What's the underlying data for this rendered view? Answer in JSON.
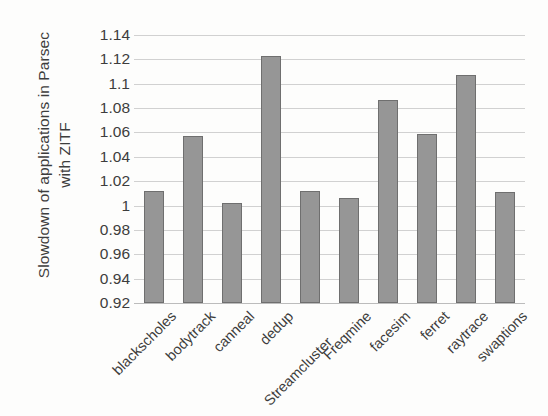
{
  "chart_data": {
    "type": "bar",
    "title": "",
    "xlabel": "",
    "ylabel": "Slowdown of applications in Parsec with ZITF",
    "ylabel_lines": [
      "Slowdown of applications in Parsec",
      "with ZITF"
    ],
    "ylim": [
      0.92,
      1.14
    ],
    "ytick_step": 0.02,
    "ytick_labels": [
      "1.14",
      "1.12",
      "1.1",
      "1.08",
      "1.06",
      "1.04",
      "1.02",
      "1",
      "0.98",
      "0.96",
      "0.94",
      "0.92"
    ],
    "ytick_values": [
      1.14,
      1.12,
      1.1,
      1.08,
      1.06,
      1.04,
      1.02,
      1.0,
      0.98,
      0.96,
      0.94,
      0.92
    ],
    "grid": true,
    "legend": "none",
    "categories": [
      "blackscholes",
      "bodytrack",
      "canneal",
      "dedup",
      "Streamcluster",
      "Freqmine",
      "facesim",
      "ferret",
      "raytrace",
      "swaptions"
    ],
    "values": [
      1.012,
      1.057,
      1.002,
      1.123,
      1.012,
      1.006,
      1.087,
      1.059,
      1.107,
      1.011
    ],
    "series": [
      {
        "name": "ZITF slowdown",
        "values": [
          1.012,
          1.057,
          1.002,
          1.123,
          1.012,
          1.006,
          1.087,
          1.059,
          1.107,
          1.011
        ]
      }
    ],
    "colors": {
      "bar_fill": "#969696",
      "bar_stroke": "#6f6f6f",
      "gridline": "#c9c9c9",
      "text": "#3d3d3d",
      "background": "#fdfdfc"
    }
  }
}
